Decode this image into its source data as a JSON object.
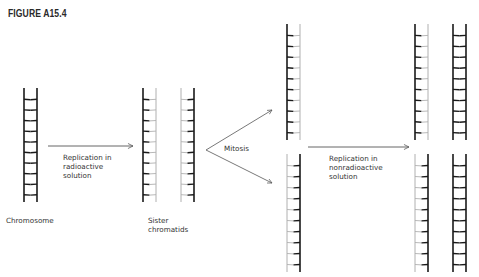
{
  "figure": {
    "title": "FIGURE A15.4"
  },
  "colors": {
    "dark_strand": "#1a1a1a",
    "light_strand": "#b0b0b0",
    "arrow": "#555555",
    "text": "#333333"
  },
  "labels": {
    "chromosome": "Chromosome",
    "sister_chromatids": "Sister\nchromatids",
    "replication_radioactive": "Replication in\nradioactive\nsolution",
    "mitosis": "Mitosis",
    "replication_nonradioactive": "Replication in\nnonradioactive\nsolution"
  },
  "stages": [
    {
      "name": "chromosome",
      "ladders": [
        {
          "strands": [
            "dark",
            "dark"
          ]
        }
      ]
    },
    {
      "name": "sister-chromatids",
      "ladders": [
        {
          "strands": [
            "dark",
            "light"
          ]
        },
        {
          "strands": [
            "light",
            "dark"
          ]
        }
      ]
    },
    {
      "name": "after-mitosis",
      "ladders": [
        {
          "strands": [
            "dark",
            "light"
          ]
        },
        {
          "strands": [
            "light",
            "dark"
          ]
        }
      ]
    },
    {
      "name": "after-nonradioactive-replication",
      "ladders": [
        {
          "strands": [
            "dark",
            "light"
          ]
        },
        {
          "strands": [
            "dark",
            "dark"
          ]
        },
        {
          "strands": [
            "light",
            "dark"
          ]
        },
        {
          "strands": [
            "dark",
            "dark"
          ]
        }
      ]
    }
  ]
}
